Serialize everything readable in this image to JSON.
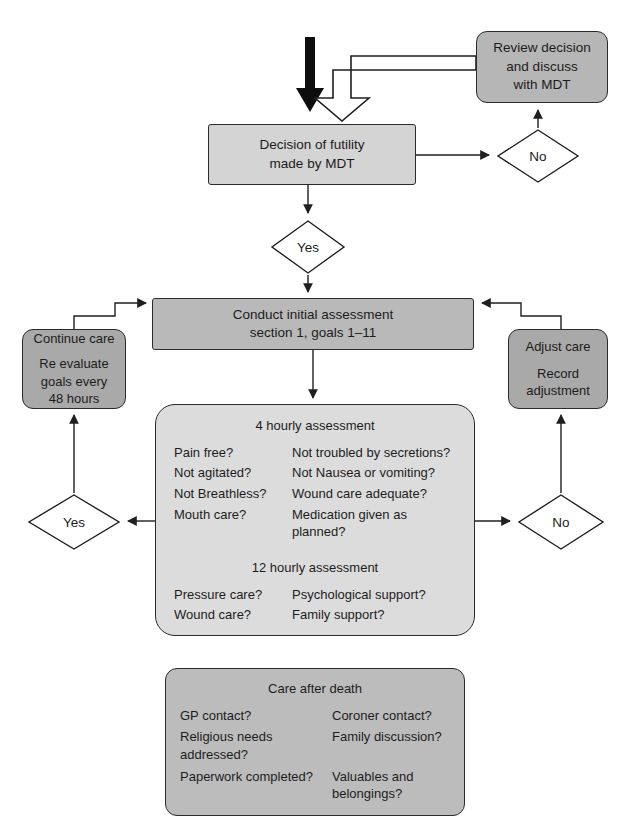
{
  "diagram": {
    "colors": {
      "dark_fill": "#a9a9a9",
      "mid_fill": "#b9b9b9",
      "light_fill": "#d4d4d4",
      "lightest_fill": "#dcdcdc",
      "stroke": "#2b2b2b",
      "text": "#1c1c1c"
    }
  },
  "nodes": {
    "review_decision": {
      "lines": [
        "Review decision",
        "and discuss",
        "with MDT"
      ]
    },
    "decision_futility": {
      "lines": [
        "Decision of futility",
        "made by MDT"
      ]
    },
    "initial_assessment": {
      "lines": [
        "Conduct initial assessment",
        "section 1, goals 1–11"
      ]
    },
    "continue_care": {
      "heading": "Continue care",
      "lines": [
        "Re evaluate",
        "goals every",
        "48 hours"
      ]
    },
    "adjust_care": {
      "heading": "Adjust care",
      "lines": [
        "Record",
        "adjustment"
      ]
    },
    "assessment": {
      "four_hourly_title": "4 hourly assessment",
      "four_hourly_left": [
        "Pain free?",
        "Not agitated?",
        "Not Breathless?",
        "Mouth care?"
      ],
      "four_hourly_right": [
        "Not troubled by secretions?",
        "Not Nausea or vomiting?",
        "Wound care adequate?",
        "Medication given as planned?"
      ],
      "twelve_hourly_title": "12 hourly assessment",
      "twelve_hourly_left": [
        "Pressure care?",
        "Wound care?"
      ],
      "twelve_hourly_right": [
        "Psychological support?",
        "Family support?"
      ]
    },
    "care_after_death": {
      "title": "Care after death",
      "left": [
        "GP contact?",
        "Religious needs addressed?",
        "Paperwork completed?"
      ],
      "right": [
        "Coroner contact?",
        "Family discussion?",
        "Valuables and belongings?"
      ]
    }
  },
  "decisions": {
    "no_top": "No",
    "yes_top": "Yes",
    "yes_left": "Yes",
    "no_right": "No"
  }
}
